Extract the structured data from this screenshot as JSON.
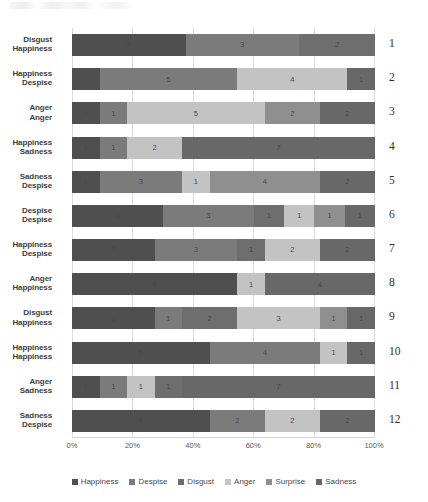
{
  "chart_data": {
    "type": "bar",
    "subtype": "stacked-bar-horizontal-percent",
    "title": "",
    "xlabel": "",
    "ylabel": "",
    "orientation": "horizontal",
    "stack_mode": "percent",
    "grid": true,
    "legend_position": "bottom",
    "xlim": [
      0,
      100
    ],
    "xtick_labels": [
      "0%",
      "20%",
      "40%",
      "60%",
      "80%",
      "100%"
    ],
    "xtick_values": [
      0,
      20,
      40,
      60,
      80,
      100
    ],
    "series": [
      {
        "name": "Happiness",
        "color": "#4f4f4f"
      },
      {
        "name": "Despise",
        "color": "#7b7b7b"
      },
      {
        "name": "Disgust",
        "color": "#6e6e6e"
      },
      {
        "name": "Anger",
        "color": "#c3c3c3"
      },
      {
        "name": "Surprise",
        "color": "#8f8f8f"
      },
      {
        "name": "Sadness",
        "color": "#686868"
      }
    ],
    "categories": [
      "Disgust / Happiness",
      "Happiness / Despise",
      "Anger / Anger",
      "Happiness / Sadness",
      "Sadness / Despise",
      "Despise / Despise",
      "Happiness / Despise",
      "Anger / Happiness",
      "Disgust / Happiness",
      "Happiness / Happiness",
      "Anger / Sadness",
      "Sadness / Despise"
    ],
    "rows": [
      {
        "index": "1",
        "label_top": "Disgust",
        "label_bottom": "Happiness",
        "total": 8,
        "segments": [
          {
            "series": "Happiness",
            "value": 3,
            "label": "3",
            "color": "#4f4f4f"
          },
          {
            "series": "Despise",
            "value": 3,
            "label": "3",
            "color": "#7b7b7b"
          },
          {
            "series": "Disgust",
            "value": 2,
            "label": "2",
            "color": "#6e6e6e"
          }
        ]
      },
      {
        "index": "2",
        "label_top": "Happiness",
        "label_bottom": "Despise",
        "total": 11,
        "segments": [
          {
            "series": "Happiness",
            "value": 1,
            "label": "",
            "color": "#4f4f4f"
          },
          {
            "series": "Despise",
            "value": 5,
            "label": "5",
            "color": "#7b7b7b"
          },
          {
            "series": "Anger",
            "value": 4,
            "label": "4",
            "color": "#c3c3c3"
          },
          {
            "series": "Sadness",
            "value": 1,
            "label": "1",
            "color": "#686868"
          }
        ]
      },
      {
        "index": "3",
        "label_top": "Anger",
        "label_bottom": "Anger",
        "total": 11,
        "segments": [
          {
            "series": "Happiness",
            "value": 1,
            "label": "1",
            "color": "#4f4f4f"
          },
          {
            "series": "Despise",
            "value": 1,
            "label": "1",
            "color": "#7b7b7b"
          },
          {
            "series": "Anger",
            "value": 5,
            "label": "5",
            "color": "#c3c3c3"
          },
          {
            "series": "Surprise",
            "value": 2,
            "label": "2",
            "color": "#8f8f8f"
          },
          {
            "series": "Sadness",
            "value": 2,
            "label": "2",
            "color": "#686868"
          }
        ]
      },
      {
        "index": "4",
        "label_top": "Happiness",
        "label_bottom": "Sadness",
        "total": 11,
        "segments": [
          {
            "series": "Happiness",
            "value": 1,
            "label": "1",
            "color": "#4f4f4f"
          },
          {
            "series": "Despise",
            "value": 1,
            "label": "1",
            "color": "#7b7b7b"
          },
          {
            "series": "Anger",
            "value": 2,
            "label": "2",
            "color": "#c3c3c3"
          },
          {
            "series": "Sadness",
            "value": 7,
            "label": "7",
            "color": "#686868"
          }
        ]
      },
      {
        "index": "5",
        "label_top": "Sadness",
        "label_bottom": "Despise",
        "total": 11,
        "segments": [
          {
            "series": "Happiness",
            "value": 1,
            "label": "1",
            "color": "#4f4f4f"
          },
          {
            "series": "Despise",
            "value": 3,
            "label": "3",
            "color": "#7b7b7b"
          },
          {
            "series": "Anger",
            "value": 1,
            "label": "1",
            "color": "#c3c3c3"
          },
          {
            "series": "Surprise",
            "value": 4,
            "label": "4",
            "color": "#8f8f8f"
          },
          {
            "series": "Sadness",
            "value": 2,
            "label": "2",
            "color": "#686868"
          }
        ]
      },
      {
        "index": "6",
        "label_top": "Despise",
        "label_bottom": "Despise",
        "total": 10,
        "segments": [
          {
            "series": "Happiness",
            "value": 3,
            "label": "3",
            "color": "#4f4f4f"
          },
          {
            "series": "Despise",
            "value": 3,
            "label": "3",
            "color": "#7b7b7b"
          },
          {
            "series": "Disgust",
            "value": 1,
            "label": "1",
            "color": "#6e6e6e"
          },
          {
            "series": "Anger",
            "value": 1,
            "label": "1",
            "color": "#c3c3c3"
          },
          {
            "series": "Surprise",
            "value": 1,
            "label": "1",
            "color": "#8f8f8f"
          },
          {
            "series": "Sadness",
            "value": 1,
            "label": "1",
            "color": "#686868"
          }
        ]
      },
      {
        "index": "7",
        "label_top": "Happiness",
        "label_bottom": "Despise",
        "total": 11,
        "segments": [
          {
            "series": "Happiness",
            "value": 3,
            "label": "3",
            "color": "#4f4f4f"
          },
          {
            "series": "Despise",
            "value": 3,
            "label": "3",
            "color": "#7b7b7b"
          },
          {
            "series": "Disgust",
            "value": 1,
            "label": "1",
            "color": "#6e6e6e"
          },
          {
            "series": "Anger",
            "value": 2,
            "label": "2",
            "color": "#c3c3c3"
          },
          {
            "series": "Sadness",
            "value": 2,
            "label": "2",
            "color": "#686868"
          }
        ]
      },
      {
        "index": "8",
        "label_top": "Anger",
        "label_bottom": "Happiness",
        "total": 11,
        "segments": [
          {
            "series": "Happiness",
            "value": 6,
            "label": "6",
            "color": "#4f4f4f"
          },
          {
            "series": "Anger",
            "value": 1,
            "label": "1",
            "color": "#c3c3c3"
          },
          {
            "series": "Sadness",
            "value": 4,
            "label": "4",
            "color": "#686868"
          }
        ]
      },
      {
        "index": "9",
        "label_top": "Disgust",
        "label_bottom": "Happiness",
        "total": 11,
        "segments": [
          {
            "series": "Happiness",
            "value": 3,
            "label": "3",
            "color": "#4f4f4f"
          },
          {
            "series": "Despise",
            "value": 1,
            "label": "1",
            "color": "#7b7b7b"
          },
          {
            "series": "Disgust",
            "value": 2,
            "label": "2",
            "color": "#6e6e6e"
          },
          {
            "series": "Anger",
            "value": 3,
            "label": "3",
            "color": "#c3c3c3"
          },
          {
            "series": "Surprise",
            "value": 1,
            "label": "1",
            "color": "#8f8f8f"
          },
          {
            "series": "Sadness",
            "value": 1,
            "label": "1",
            "color": "#686868"
          }
        ]
      },
      {
        "index": "10",
        "label_top": "Happiness",
        "label_bottom": "Happiness",
        "total": 11,
        "segments": [
          {
            "series": "Happiness",
            "value": 5,
            "label": "5",
            "color": "#4f4f4f"
          },
          {
            "series": "Despise",
            "value": 4,
            "label": "4",
            "color": "#7b7b7b"
          },
          {
            "series": "Anger",
            "value": 1,
            "label": "1",
            "color": "#c3c3c3"
          },
          {
            "series": "Sadness",
            "value": 1,
            "label": "1",
            "color": "#686868"
          }
        ]
      },
      {
        "index": "11",
        "label_top": "Anger",
        "label_bottom": "Sadness",
        "total": 11,
        "segments": [
          {
            "series": "Happiness",
            "value": 1,
            "label": "1",
            "color": "#4f4f4f"
          },
          {
            "series": "Despise",
            "value": 1,
            "label": "1",
            "color": "#7b7b7b"
          },
          {
            "series": "Anger",
            "value": 1,
            "label": "1",
            "color": "#c3c3c3"
          },
          {
            "series": "Disgust",
            "value": 1,
            "label": "1",
            "color": "#6e6e6e"
          },
          {
            "series": "Sadness",
            "value": 7,
            "label": "7",
            "color": "#686868"
          }
        ]
      },
      {
        "index": "12",
        "label_top": "Sadness",
        "label_bottom": "Despise",
        "total": 11,
        "segments": [
          {
            "series": "Happiness",
            "value": 5,
            "label": "5",
            "color": "#4f4f4f"
          },
          {
            "series": "Despise",
            "value": 2,
            "label": "2",
            "color": "#7b7b7b"
          },
          {
            "series": "Anger",
            "value": 2,
            "label": "2",
            "color": "#c3c3c3"
          },
          {
            "series": "Sadness",
            "value": 2,
            "label": "2",
            "color": "#686868"
          }
        ]
      }
    ]
  }
}
